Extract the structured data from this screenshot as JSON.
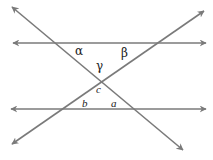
{
  "diagram": {
    "title": "",
    "line_color": "#7a7a7a",
    "label_color": "#222222",
    "lines": [
      {
        "id": "top-horizontal",
        "x1": 13,
        "y1": 43,
        "x2": 206,
        "y2": 43,
        "arrows": "both"
      },
      {
        "id": "bottom-horizontal",
        "x1": 11,
        "y1": 109,
        "x2": 206,
        "y2": 109,
        "arrows": "both"
      },
      {
        "id": "descending-transversal",
        "x1": 12,
        "y1": 7,
        "x2": 183,
        "y2": 150,
        "arrows": "both"
      },
      {
        "id": "ascending-transversal",
        "x1": 12,
        "y1": 144,
        "x2": 204,
        "y2": 11,
        "arrows": "both"
      }
    ],
    "labels": {
      "alpha": {
        "text": "α",
        "x": 79,
        "y": 55
      },
      "beta": {
        "text": "β",
        "x": 125,
        "y": 57
      },
      "gamma": {
        "text": "γ",
        "x": 100,
        "y": 70
      },
      "c": {
        "text": "c",
        "x": 99,
        "y": 93
      },
      "b": {
        "text": "b",
        "x": 85,
        "y": 107
      },
      "a": {
        "text": "a",
        "x": 114,
        "y": 107
      }
    }
  }
}
